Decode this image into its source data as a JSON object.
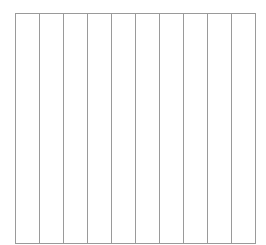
{
  "chart_data": {
    "type": "table",
    "title": "",
    "xlabel": "",
    "ylabel": "",
    "columns": 10,
    "grid": {
      "vertical_lines": 11,
      "horizontal_lines": 2,
      "line_color": "#9a9a9a"
    },
    "categories": [],
    "values": []
  },
  "colors": {
    "background": "#ffffff",
    "grid": "#9a9a9a"
  }
}
